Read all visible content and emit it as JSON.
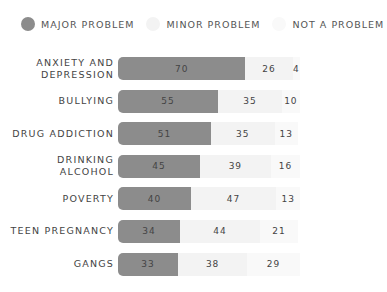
{
  "legend": [
    {
      "label": "MAJOR PROBLEM",
      "color": "#8c8c8c"
    },
    {
      "label": "MINOR PROBLEM",
      "color": "#f3f3f3"
    },
    {
      "label": "NOT A PROBLEM",
      "color": "#f9f9f9"
    }
  ],
  "chart_data": {
    "type": "bar",
    "orientation": "horizontal",
    "stacked": true,
    "title": "",
    "xlabel": "",
    "ylabel": "",
    "categories": [
      "ANXIETY AND DEPRESSION",
      "BULLYING",
      "DRUG ADDICTION",
      "DRINKING ALCOHOL",
      "POVERTY",
      "TEEN PREGNANCY",
      "GANGS"
    ],
    "series": [
      {
        "name": "MAJOR PROBLEM",
        "color": "#8c8c8c",
        "values": [
          70,
          55,
          51,
          45,
          40,
          34,
          33
        ]
      },
      {
        "name": "MINOR PROBLEM",
        "color": "#f3f3f3",
        "values": [
          26,
          35,
          35,
          39,
          47,
          44,
          38
        ]
      },
      {
        "name": "NOT A PROBLEM",
        "color": "#f9f9f9",
        "values": [
          4,
          10,
          13,
          16,
          13,
          21,
          29
        ]
      }
    ],
    "legend_position": "top",
    "grid": false,
    "xlim": [
      0,
      100
    ]
  },
  "rows": [
    {
      "label": "ANXIETY AND\nDEPRESSION",
      "major": "70",
      "minor": "26",
      "not": "4"
    },
    {
      "label": "BULLYING",
      "major": "55",
      "minor": "35",
      "not": "10"
    },
    {
      "label": "DRUG ADDICTION",
      "major": "51",
      "minor": "35",
      "not": "13"
    },
    {
      "label": "DRINKING ALCOHOL",
      "major": "45",
      "minor": "39",
      "not": "16"
    },
    {
      "label": "POVERTY",
      "major": "40",
      "minor": "47",
      "not": "13"
    },
    {
      "label": "TEEN PREGNANCY",
      "major": "34",
      "minor": "44",
      "not": "21"
    },
    {
      "label": "GANGS",
      "major": "33",
      "minor": "38",
      "not": "29"
    }
  ]
}
